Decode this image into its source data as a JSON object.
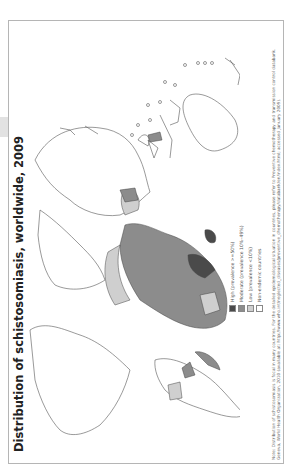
{
  "page": {
    "tab_indicator": "page-tab"
  },
  "map": {
    "title": "Distribution of schistosomiasis, worldwide, 2009",
    "orientation": "rotated 90° counter-clockwise",
    "legend": {
      "items": [
        {
          "label": "High (prevalence >=50%)",
          "color": "#4a4a4a"
        },
        {
          "label": "Moderate (prevalence 10%–49%)",
          "color": "#8c8c8c"
        },
        {
          "label": "Low (prevalence <10%)",
          "color": "#cfcfcf"
        },
        {
          "label": "Non-endemic countries",
          "color": "#ffffff"
        }
      ]
    },
    "note": "Note: Distribution of schistosomiasis is focal in many countries. For the detailed epidemiological situation in countries, please refer to Preventive chemotherapy and transmission control databank. Geneva, World Health Organization, 2010 (available at: http://www.who.int/neglected_diseases/preventive_chemotherapy/databank/en/index.html; accessed January 2009)."
  }
}
